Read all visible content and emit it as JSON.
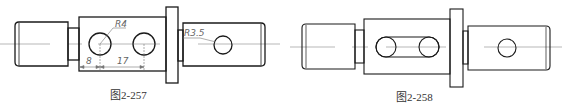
{
  "figures": [
    {
      "caption": "图2-257",
      "annotations": {
        "radius_large": "R4",
        "radius_small": "R3.5",
        "dim_offset": "8",
        "dim_spacing": "17"
      },
      "features": [
        "two round holes on main body",
        "one round hole on right shaft"
      ]
    },
    {
      "caption": "图2-258",
      "features": [
        "slot (obround keyway) on main body",
        "one round hole on right shaft"
      ]
    }
  ],
  "colors": {
    "outline": "#1a1a1a",
    "centerline": "#888888",
    "dimension": "#777777"
  }
}
